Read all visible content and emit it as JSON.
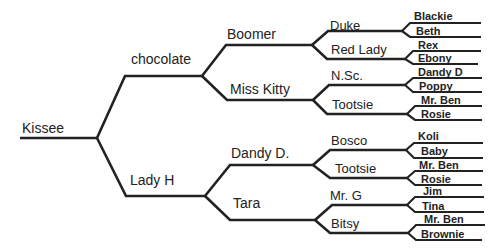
{
  "diagram": {
    "type": "pedigree-tree",
    "root": {
      "label": "Kissee"
    },
    "generation1": [
      {
        "label": "chocolate"
      },
      {
        "label": "Lady H"
      }
    ],
    "generation2": [
      {
        "label": "Boomer"
      },
      {
        "label": "Miss Kitty"
      },
      {
        "label": "Dandy D."
      },
      {
        "label": "Tara"
      }
    ],
    "generation3": [
      {
        "label": "Duke"
      },
      {
        "label": "Red Lady"
      },
      {
        "label": "N.Sc."
      },
      {
        "label": "Tootsie"
      },
      {
        "label": "Bosco"
      },
      {
        "label": "Tootsie"
      },
      {
        "label": "Mr. G"
      },
      {
        "label": "Bitsy"
      }
    ],
    "generation4": [
      {
        "label": "Blackie"
      },
      {
        "label": "Beth"
      },
      {
        "label": "Rex"
      },
      {
        "label": "Ebony"
      },
      {
        "label": "Dandy D"
      },
      {
        "label": "Poppy"
      },
      {
        "label": "Mr. Ben"
      },
      {
        "label": "Rosie"
      },
      {
        "label": "Koli"
      },
      {
        "label": "Baby"
      },
      {
        "label": "Mr. Ben"
      },
      {
        "label": "Rosie"
      },
      {
        "label": "Jim"
      },
      {
        "label": "Tina"
      },
      {
        "label": "Mr. Ben"
      },
      {
        "label": "Brownie"
      }
    ],
    "colors": {
      "line": "#222222",
      "text": "#222222",
      "background": "#ffffff"
    }
  }
}
